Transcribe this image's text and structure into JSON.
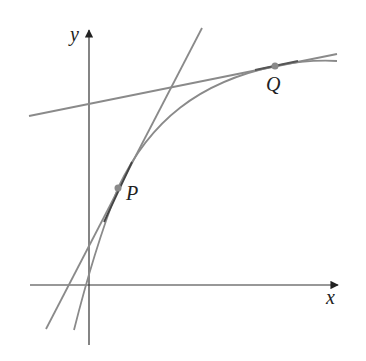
{
  "figure": {
    "axes": {
      "x_label": "x",
      "y_label": "y",
      "origin_px": [
        89,
        285
      ],
      "x_axis_px": {
        "from": [
          30,
          285
        ],
        "to": [
          338,
          285
        ]
      },
      "y_axis_px": {
        "from": [
          89,
          345
        ],
        "to": [
          89,
          30
        ]
      }
    },
    "points": [
      {
        "label": "P",
        "px": [
          118,
          188
        ]
      },
      {
        "label": "Q",
        "px": [
          275,
          66
        ]
      }
    ],
    "curve": {
      "shape": "concave-down increasing, leveling off to the right",
      "px_path": [
        [
          74,
          330
        ],
        [
          90,
          265
        ],
        [
          105,
          222
        ],
        [
          118,
          188
        ],
        [
          140,
          150
        ],
        [
          170,
          114
        ],
        [
          205,
          90
        ],
        [
          240,
          75
        ],
        [
          275,
          66
        ],
        [
          310,
          61
        ],
        [
          337,
          61
        ]
      ]
    },
    "tangent_at_P": {
      "from_px": [
        46,
        329
      ],
      "to_px": [
        202,
        28
      ]
    },
    "tangent_at_Q": {
      "from_px": [
        29,
        116
      ],
      "to_px": [
        337,
        54
      ]
    },
    "colors": {
      "axis": "#222222",
      "curve": "#8a8a8a",
      "tangent": "#8a8a8a",
      "point": "#8a8a8a",
      "label": "#222222"
    }
  }
}
